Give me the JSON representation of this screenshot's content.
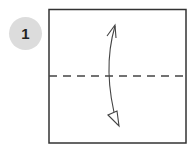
{
  "step": {
    "number": "1",
    "badge_color": "#dcdcdc"
  },
  "diagram": {
    "paper_square": {
      "x": 49,
      "y": 9,
      "width": 137,
      "height": 134,
      "stroke": "#333333"
    },
    "fold_line": {
      "type": "valley-fold-dashed",
      "y": 76,
      "stroke": "#444444",
      "dash": "8 6"
    },
    "arrow": {
      "type": "fold-and-unfold",
      "direction": "vertical",
      "top_head": "open-hook",
      "bottom_head": "hollow-triangle"
    }
  }
}
